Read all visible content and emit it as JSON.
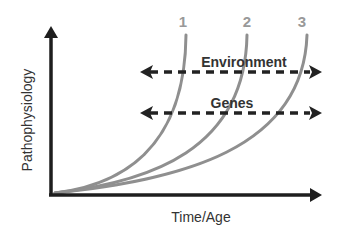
{
  "diagram": {
    "axes": {
      "y_label": "Pathophysiology",
      "x_label": "Time/Age"
    },
    "curves": [
      {
        "label": "1",
        "color": "#8f8f8f"
      },
      {
        "label": "2",
        "color": "#8f8f8f"
      },
      {
        "label": "3",
        "color": "#8f8f8f"
      }
    ],
    "factors": [
      {
        "label": "Environment",
        "style": "dashed double-headed arrow"
      },
      {
        "label": "Genes",
        "style": "dashed double-headed arrow"
      }
    ],
    "colors": {
      "axis": "#1e1e1e",
      "curve": "#8f8f8f",
      "text": "#333333",
      "background": "#ffffff"
    }
  }
}
